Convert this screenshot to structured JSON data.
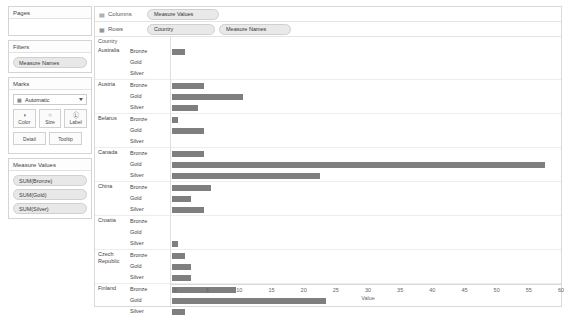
{
  "sidebar": {
    "pages": {
      "title": "Pages"
    },
    "filters": {
      "title": "Filters",
      "items": [
        "Measure Names"
      ]
    },
    "marks": {
      "title": "Marks",
      "dropdown_icon": "bar-mark-icon",
      "dropdown_value": "Automatic",
      "buttons": [
        {
          "name": "color",
          "label": "Color",
          "glyph": "◑"
        },
        {
          "name": "size",
          "label": "Size",
          "glyph": "○"
        },
        {
          "name": "label",
          "label": "Label",
          "glyph": "Ⓛ"
        }
      ],
      "buttons_small": [
        {
          "name": "detail",
          "label": "Detail"
        },
        {
          "name": "tooltip",
          "label": "Tooltip"
        }
      ]
    },
    "measure_values": {
      "title": "Measure Values",
      "items": [
        "SUM(Bronze)",
        "SUM(Gold)",
        "SUM(Silver)"
      ]
    }
  },
  "shelves": {
    "columns": {
      "icon": "columns-icon",
      "label": "Columns",
      "pills": [
        "Measure Values"
      ]
    },
    "rows": {
      "icon": "rows-icon",
      "label": "Rows",
      "pills": [
        "Country",
        "Measure Names"
      ]
    }
  },
  "viz": {
    "row_header_title": "Country",
    "bar_color": "#7f7f7f"
  },
  "chart_data": {
    "type": "bar",
    "title": "",
    "xlabel": "Value",
    "ylabel": "Country",
    "xlim": [
      0,
      60
    ],
    "xticks": [
      0,
      5,
      10,
      15,
      20,
      25,
      30,
      35,
      40,
      45,
      50,
      55,
      60
    ],
    "grid": false,
    "legend": "none",
    "categories": [
      "Bronze",
      "Gold",
      "Silver"
    ],
    "groups": [
      {
        "country": "Australia",
        "values": [
          2,
          0,
          0
        ]
      },
      {
        "country": "Austria",
        "values": [
          5,
          11,
          4
        ]
      },
      {
        "country": "Belarus",
        "values": [
          1,
          5,
          0
        ]
      },
      {
        "country": "Canada",
        "values": [
          5,
          58,
          23
        ]
      },
      {
        "country": "China",
        "values": [
          6,
          3,
          5
        ]
      },
      {
        "country": "Croatia",
        "values": [
          0,
          0,
          1
        ]
      },
      {
        "country": "Czech Republic",
        "values": [
          2,
          3,
          3
        ]
      },
      {
        "country": "Finland",
        "values": [
          10,
          24,
          2
        ]
      }
    ]
  }
}
